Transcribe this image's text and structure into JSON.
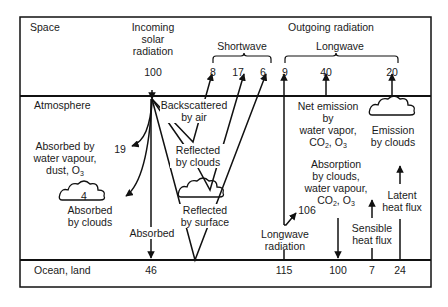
{
  "diagram": {
    "zones": {
      "space": "Space",
      "atmosphere": "Atmosphere",
      "surface": "Ocean, land"
    },
    "incoming": {
      "label_line1": "Incoming",
      "label_line2": "solar",
      "label_line3": "radiation",
      "value": "100"
    },
    "outgoing": {
      "label": "Outgoing radiation",
      "shortwave_label": "Shortwave",
      "longwave_label": "Longwave",
      "shortwave_values": [
        "8",
        "17",
        "6"
      ],
      "longwave_values": [
        "9",
        "40",
        "20"
      ]
    },
    "labels": {
      "backscattered_1": "Backscattered",
      "backscattered_2": "by air",
      "reflected_clouds_1": "Reflected",
      "reflected_clouds_2": "by clouds",
      "reflected_surface_1": "Reflected",
      "reflected_surface_2": "by surface",
      "absorbed_wv_1": "Absorbed by",
      "absorbed_wv_2": "water vapour,",
      "absorbed_wv_3": "dust, O",
      "absorbed_wv_value": "19",
      "absorbed_clouds_value": "4",
      "absorbed_clouds_1": "Absorbed",
      "absorbed_clouds_2": "by clouds",
      "absorbed_surface": "Absorbed",
      "net_emission_1": "Net emission",
      "net_emission_2": "by",
      "net_emission_3": "water vapor,",
      "net_emission_4a": "CO",
      "net_emission_4b": ", O",
      "emission_clouds_1": "Emission",
      "emission_clouds_2": "by clouds",
      "absorption_1": "Absorption",
      "absorption_2": "by clouds,",
      "absorption_3": "water vapour,",
      "absorption_4a": "CO",
      "absorption_4b": ", O",
      "absorption_value": "106",
      "longwave_rad_1": "Longwave",
      "longwave_rad_2": "radiation",
      "sensible_1": "Sensible",
      "sensible_2": "heat flux",
      "latent_1": "Latent",
      "latent_2": "heat flux",
      "sub_2": "2",
      "sub_3": "3"
    },
    "surface_values": {
      "absorbed": "46",
      "longwave": "115",
      "back_radiation": "100",
      "sensible": "7",
      "latent": "24"
    },
    "colors": {
      "line": "#111111",
      "background": "#ffffff"
    }
  }
}
